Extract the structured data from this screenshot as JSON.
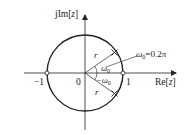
{
  "diagram": {
    "type": "z-plane pole-zero plot",
    "axes": {
      "imag_label_prefix": "jIm[",
      "imag_label_var": "z",
      "imag_label_suffix": "]",
      "real_label_prefix": "Re[",
      "real_label_var": "z",
      "real_label_suffix": "]"
    },
    "tick_labels": {
      "minus_one": "−1",
      "origin": "0",
      "one": "1"
    },
    "unit_circle": {
      "radius": 1
    },
    "zeros": [
      {
        "re": -1,
        "im": 0
      },
      {
        "re": 1,
        "im": 0
      }
    ],
    "poles": [
      {
        "radius_label": "r",
        "angle_label": "ω",
        "angle_sub": "0",
        "angle": "0.2π"
      },
      {
        "radius_label": "r",
        "angle_label": "−ω",
        "angle_sub": "0",
        "angle": "-0.2π"
      }
    ],
    "annotation": {
      "omega": "ω",
      "sub": "0",
      "value": "=0.2π"
    },
    "colors": {
      "stroke": "#222222",
      "background": "#ffffff"
    }
  }
}
